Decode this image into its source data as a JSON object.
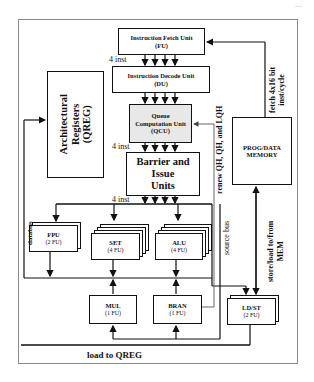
{
  "page_number": "---",
  "units": {
    "fetch": {
      "name": "Instruction Fetch Unit",
      "abbr": "(FU)"
    },
    "decode": {
      "name": "Instruction Decode Unit",
      "abbr": "(DU)"
    },
    "qcu": {
      "line1": "Queue",
      "line2": "Computation Unit",
      "abbr": "(QCU)",
      "fill": "#e8e8e8"
    },
    "barrier": {
      "line1": "Barrier and",
      "line2": "Issue",
      "line3": "Units"
    },
    "qreg": {
      "line1": "Architectural",
      "line2": "Registers",
      "line3": "(QREG)"
    },
    "memory": {
      "line1": "PROG/DATA",
      "line2": "MEMORY"
    },
    "fpu": {
      "name": "FPU",
      "count": "(2 FU)"
    },
    "set": {
      "name": "SET",
      "count": "(4 FU)"
    },
    "alu": {
      "name": "ALU",
      "count": "(4 FU)"
    },
    "mul": {
      "name": "MUL",
      "count": "(1 FU)"
    },
    "bran": {
      "name": "BRAN",
      "count": "(1 FU)"
    },
    "ldst": {
      "name": "LD/ST",
      "count": "(2 FU)"
    }
  },
  "labels": {
    "inst_fu_du": "4 inst",
    "inst_qcu_barrier": "4 inst",
    "inst_barrier_fus": "4 inst",
    "fetch_line1": "fetch 4x16 bit",
    "fetch_line2": "inst/cycle",
    "renew": "renew QH, QH, and LQH",
    "databus": "databus",
    "source_bus": "source bus",
    "store_line1": "store/load to/from",
    "store_line2": "MEM",
    "load_to_qreg": "load to QREG"
  }
}
